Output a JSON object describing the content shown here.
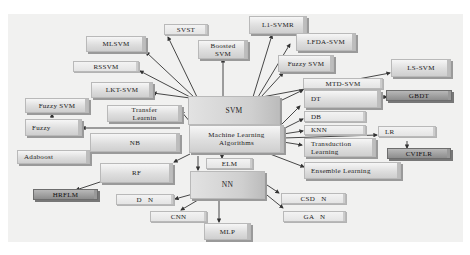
{
  "diagram": {
    "colors": {
      "background": "#f1f1f0",
      "node_fill": "#dedede",
      "node_dark": "#8d8d8d",
      "edge": "#333333"
    },
    "nodes": {
      "root": "Machine Learning\nAlgorithms",
      "svm": "SVM",
      "nn": "NN",
      "elm": "ELM",
      "mlsvm": "MLSVM",
      "svst": "SVST",
      "boosted_svm": "Boosted\nSVM",
      "l1_svmr": "L1-SVMR",
      "lfda_svm": "LFDA-SVM",
      "fuzzy_svm_right": "Fuzzy SVM",
      "ls_svm": "LS-SVM",
      "mtd_svm": "MTD-SVM",
      "rssvm": "RSSVM",
      "lkt_svm": "LKT-SVM",
      "fuzzy_svm_left": "Fuzzy SVM",
      "fuzzy": "Fuzzy",
      "transfer_learning": "Transfer\nLearnin",
      "nb": "NB",
      "adaboost": "Adaboost",
      "rf": "RF",
      "hrflm": "HRFLM",
      "dt": "DT",
      "gbdt": "GBDT",
      "db": "DB",
      "knn": "KNN",
      "lr": "LR",
      "cviflr": "CVIFLR",
      "transduction_learning": "Transduction\nLearning",
      "ensemble_learning": "Ensemble Learning",
      "dnn": "D   N",
      "cnn": "CNN",
      "mlp": "MLP",
      "csdnn": "CSD   N",
      "gann": "GA   N"
    },
    "edges": [
      [
        "root",
        "svm"
      ],
      [
        "root",
        "nn"
      ],
      [
        "root",
        "elm"
      ],
      [
        "root",
        "fuzzy"
      ],
      [
        "root",
        "nb"
      ],
      [
        "root",
        "adaboost"
      ],
      [
        "root",
        "rf"
      ],
      [
        "root",
        "transfer_learning"
      ],
      [
        "root",
        "dt"
      ],
      [
        "root",
        "db"
      ],
      [
        "root",
        "knn"
      ],
      [
        "root",
        "lr"
      ],
      [
        "root",
        "transduction_learning"
      ],
      [
        "root",
        "ensemble_learning"
      ],
      [
        "svm",
        "mlsvm"
      ],
      [
        "svm",
        "svst"
      ],
      [
        "svm",
        "boosted_svm"
      ],
      [
        "svm",
        "l1_svmr"
      ],
      [
        "svm",
        "lfda_svm"
      ],
      [
        "svm",
        "fuzzy_svm_right"
      ],
      [
        "svm",
        "ls_svm"
      ],
      [
        "svm",
        "mtd_svm"
      ],
      [
        "svm",
        "rssvm"
      ],
      [
        "svm",
        "lkt_svm"
      ],
      [
        "fuzzy",
        "fuzzy_svm_left"
      ],
      [
        "rf",
        "hrflm"
      ],
      [
        "dt",
        "gbdt"
      ],
      [
        "lr",
        "cviflr"
      ],
      [
        "nn",
        "dnn"
      ],
      [
        "nn",
        "cnn"
      ],
      [
        "nn",
        "mlp"
      ],
      [
        "nn",
        "csdnn"
      ],
      [
        "nn",
        "gann"
      ]
    ]
  }
}
